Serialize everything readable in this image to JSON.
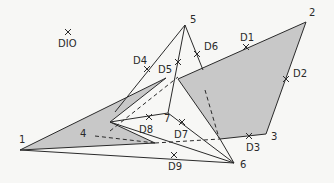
{
  "diagram": {
    "colors": {
      "background": "#f7f7f5",
      "line": "#2a2a2a",
      "shade": "#c8c8c8"
    },
    "nodes": [
      {
        "id": "1",
        "label": "1",
        "x": 20,
        "y": 150,
        "lx": 19,
        "ly": 143
      },
      {
        "id": "2",
        "label": "2",
        "x": 306,
        "y": 22,
        "lx": 309,
        "ly": 16
      },
      {
        "id": "3",
        "label": "3",
        "x": 266,
        "y": 134,
        "lx": 271,
        "ly": 140
      },
      {
        "id": "4",
        "label": "4",
        "x": 110,
        "y": 131,
        "lx": 80,
        "ly": 137
      },
      {
        "id": "5",
        "label": "5",
        "x": 185,
        "y": 25,
        "lx": 190,
        "ly": 23
      },
      {
        "id": "6",
        "label": "6",
        "x": 234,
        "y": 163,
        "lx": 240,
        "ly": 168
      },
      {
        "id": "7",
        "label": "7",
        "x": 168,
        "y": 113,
        "lx": 164,
        "ly": 122
      }
    ],
    "markers": [
      {
        "id": "D1",
        "label": "D1",
        "x": 246,
        "y": 47,
        "lx": 240,
        "ly": 41
      },
      {
        "id": "D2",
        "label": "D2",
        "x": 286,
        "y": 79,
        "lx": 293,
        "ly": 77
      },
      {
        "id": "D3",
        "label": "D3",
        "x": 249,
        "y": 136,
        "lx": 246,
        "ly": 151
      },
      {
        "id": "D4",
        "label": "D4",
        "x": 147,
        "y": 69,
        "lx": 133,
        "ly": 64
      },
      {
        "id": "D5",
        "label": "D5",
        "x": 178,
        "y": 62,
        "lx": 158,
        "ly": 73
      },
      {
        "id": "D6",
        "label": "D6",
        "x": 197,
        "y": 54,
        "lx": 204,
        "ly": 50
      },
      {
        "id": "D7",
        "label": "D7",
        "x": 182,
        "y": 122,
        "lx": 174,
        "ly": 138
      },
      {
        "id": "D8",
        "label": "D8",
        "x": 149,
        "y": 117,
        "lx": 139,
        "ly": 133
      },
      {
        "id": "D9",
        "label": "D9",
        "x": 174,
        "y": 155,
        "lx": 168,
        "ly": 170
      },
      {
        "id": "D10",
        "label": "DIO",
        "x": 68,
        "y": 32,
        "lx": 58,
        "ly": 47
      }
    ],
    "regions": [
      {
        "id": "right-region",
        "points": "178,79 306,22 266,134 220,139"
      },
      {
        "id": "left-region",
        "points": "20,150 166,78 110,122 155,143"
      }
    ],
    "edges": [
      {
        "id": "e-5-D4-down",
        "points": "185,25 115,112"
      },
      {
        "id": "e-5-7",
        "points": "185,25 168,113"
      },
      {
        "id": "e-5-right",
        "points": "185,25 203,70"
      },
      {
        "id": "e-7-6",
        "points": "168,113 234,163"
      },
      {
        "id": "e-7-4",
        "points": "168,113 110,122"
      },
      {
        "id": "e-4-6",
        "points": "110,122 234,163"
      },
      {
        "id": "e-1-6",
        "points": "20,150 234,163"
      },
      {
        "id": "e-right-6",
        "points": "220,139 234,163"
      }
    ],
    "dashed_edges": [
      {
        "id": "d-4-D5",
        "points": "110,131 178,77"
      },
      {
        "id": "d-inside-right",
        "points": "205,90 219,138"
      },
      {
        "id": "d-4-crossbar",
        "points": "95,136 155,143"
      },
      {
        "id": "d-bottom",
        "points": "155,143 220,139"
      }
    ]
  }
}
